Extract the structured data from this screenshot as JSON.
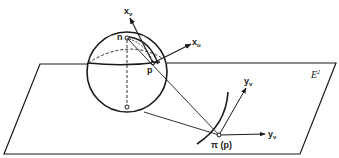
{
  "figure": {
    "plane_label": "E",
    "plane_label_sup": "2",
    "points": {
      "north_pole": "n",
      "point_on_sphere": "p",
      "projection": "π (p)"
    },
    "vectors": {
      "x_v": {
        "base": "x",
        "sub": "v"
      },
      "x_u": {
        "base": "x",
        "sub": "u"
      },
      "y_v_upper": {
        "base": "y",
        "sub": "v"
      },
      "y_v_lower": {
        "base": "y",
        "sub": "v"
      }
    },
    "colors": {
      "ink": "#1a1a1a",
      "background": "#ffffff"
    }
  }
}
